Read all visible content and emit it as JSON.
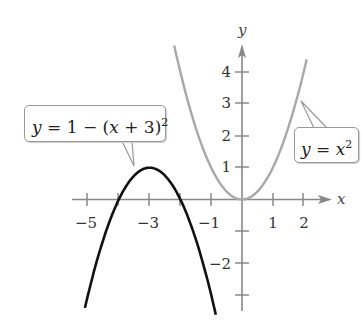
{
  "chart_data": {
    "type": "line",
    "title": "",
    "xlabel": "x",
    "ylabel": "y",
    "xlim": [
      -5.3,
      3.1
    ],
    "ylim": [
      -3.5,
      4.9
    ],
    "grid": false,
    "x_ticks": [
      -5,
      -4,
      -3,
      -2,
      -1,
      1,
      2
    ],
    "x_tick_labels": [
      "-5",
      "-3",
      "-1",
      "1",
      "2"
    ],
    "y_ticks": [
      4,
      3,
      2,
      1,
      -1,
      -2,
      -3
    ],
    "y_tick_labels": [
      "4",
      "3",
      "2",
      "1",
      "-2"
    ],
    "series": [
      {
        "name": "y = x^2",
        "color": "#a0a0a0",
        "x": [
          -2.2,
          -2,
          -1.5,
          -1,
          -0.5,
          0,
          0.5,
          1,
          1.5,
          2,
          2.1
        ],
        "values": [
          4.84,
          4,
          2.25,
          1,
          0.25,
          0,
          0.25,
          1,
          2.25,
          4,
          4.41
        ]
      },
      {
        "name": "y = 1 - (x + 3)^2",
        "color": "#111111",
        "x": [
          -5.1,
          -5,
          -4.5,
          -4,
          -3.5,
          -3,
          -2.5,
          -2,
          -1.5,
          -1,
          -0.85
        ],
        "values": [
          -3.41,
          -3,
          -1.25,
          0,
          0.75,
          1,
          0.75,
          0,
          -1.25,
          -3,
          -3.62
        ]
      }
    ],
    "annotations": [
      {
        "text": "y = 1 − (x + 3)²",
        "points_to": "vertex (-3, 1) region"
      },
      {
        "text": "y = x²",
        "points_to": "point near (1.9, 3.2)"
      }
    ]
  },
  "labels": {
    "x_axis": "x",
    "y_axis": "y",
    "xt_m5": "−5",
    "xt_m3": "−3",
    "xt_m1": "−1",
    "xt_1": "1",
    "xt_2": "2",
    "yt_4": "4",
    "yt_3": "3",
    "yt_2": "2",
    "yt_1": "1",
    "yt_m2": "−2"
  },
  "callouts": {
    "left": {
      "lhs": "y",
      "mid": " = 1 − (",
      "var": "x",
      "rest": " + 3)",
      "exp": "2"
    },
    "right": {
      "lhs": "y",
      "mid": " = ",
      "var": "x",
      "exp": "2"
    }
  }
}
